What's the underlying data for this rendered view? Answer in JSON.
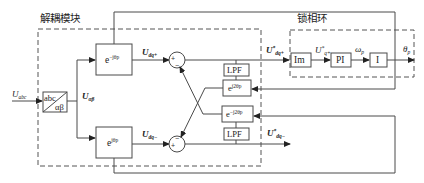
{
  "diagram": {
    "modules": {
      "decoupling": "解耦模块",
      "pll": "锁相环"
    },
    "blocks": {
      "abc_ab_top": "abc",
      "abc_ab_bottom": "αβ",
      "rot_neg_base": "e",
      "rot_neg_exp": "−jθp",
      "rot_pos_base": "e",
      "rot_pos_exp": "jθp",
      "lpf_top": "LPF",
      "lpf_bottom": "LPF",
      "rot_2pos_base": "e",
      "rot_2pos_exp": "j2θp",
      "rot_2neg_base": "e",
      "rot_2neg_exp": "−j2θp",
      "im": "Im",
      "pi": "PI",
      "integrator": "I"
    },
    "signals": {
      "u_abc": "U",
      "u_abc_sub": "abc",
      "u_ab": "U",
      "u_ab_sub": "αβ",
      "u_dqp": "U",
      "u_dqp_sub": "dq+",
      "u_dqn": "U",
      "u_dqn_sub": "dq−",
      "u_dqp_star": "U",
      "u_dqp_star_sup": "*",
      "u_dqp_star_sub": "dq+",
      "u_dqn_star": "U",
      "u_dqn_star_sup": "*",
      "u_dqn_star_sub": "dq−",
      "u_qp_star": "U",
      "u_qp_star_sup": "*",
      "u_qp_star_sub": "q+",
      "omega_p": "ω",
      "omega_p_sub": "p",
      "theta_p": "θ",
      "theta_p_sub": "p"
    },
    "summers": {
      "top_plus": "+",
      "top_minus": "−",
      "bottom_plus": "+",
      "bottom_minus": "−"
    }
  }
}
